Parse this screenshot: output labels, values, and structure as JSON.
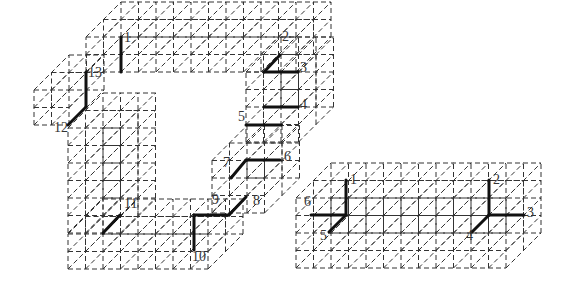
{
  "figure_left": {
    "labels": [
      {
        "text": "1",
        "x": 124,
        "y": 38
      },
      {
        "text": "2",
        "x": 282,
        "y": 37
      },
      {
        "text": "3",
        "x": 300,
        "y": 68
      },
      {
        "text": "4",
        "x": 300,
        "y": 105
      },
      {
        "text": "5",
        "x": 238,
        "y": 117
      },
      {
        "text": "6",
        "x": 284,
        "y": 157
      },
      {
        "text": "7",
        "x": 223,
        "y": 163
      },
      {
        "text": "8",
        "x": 253,
        "y": 201
      },
      {
        "text": "9",
        "x": 212,
        "y": 200
      },
      {
        "text": "10",
        "x": 192,
        "y": 257
      },
      {
        "text": "11",
        "x": 124,
        "y": 204
      },
      {
        "text": "12",
        "x": 54,
        "y": 128
      },
      {
        "text": "13",
        "x": 88,
        "y": 73
      }
    ],
    "edges": [
      [
        121,
        37,
        121,
        72
      ],
      [
        86,
        72,
        86,
        107
      ],
      [
        86,
        107,
        68,
        125
      ],
      [
        264,
        72,
        280,
        55
      ],
      [
        264,
        72,
        298,
        72
      ],
      [
        264,
        107,
        298,
        107
      ],
      [
        246,
        125,
        281,
        125
      ],
      [
        246,
        160,
        280,
        160
      ],
      [
        246,
        160,
        231,
        178
      ],
      [
        229,
        215,
        246,
        197
      ],
      [
        194,
        215,
        229,
        215
      ],
      [
        194,
        215,
        194,
        250
      ],
      [
        103,
        233,
        120,
        215
      ]
    ]
  },
  "figure_right": {
    "labels": [
      {
        "text": "1",
        "x": 350,
        "y": 180
      },
      {
        "text": "6",
        "x": 304,
        "y": 202
      },
      {
        "text": "5",
        "x": 320,
        "y": 236
      },
      {
        "text": "2",
        "x": 493,
        "y": 180
      },
      {
        "text": "3",
        "x": 527,
        "y": 213
      },
      {
        "text": "4",
        "x": 466,
        "y": 236
      }
    ],
    "edges": [
      [
        346,
        180,
        346,
        215
      ],
      [
        311,
        215,
        346,
        215
      ],
      [
        346,
        215,
        329,
        232
      ],
      [
        489,
        180,
        489,
        215
      ],
      [
        489,
        215,
        524,
        215
      ],
      [
        489,
        215,
        472,
        232
      ]
    ]
  }
}
